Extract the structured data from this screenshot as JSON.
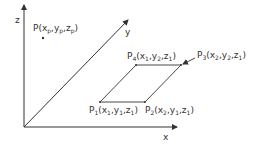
{
  "diagram": {
    "colors": {
      "line": "#333333",
      "background": "#ffffff"
    },
    "axes": {
      "x": {
        "label": "x"
      },
      "y": {
        "label": "y"
      },
      "z": {
        "label": "z"
      }
    },
    "point_p": {
      "name": "P",
      "open": "(",
      "x": "x",
      "x_sub": "p",
      "y": "y",
      "y_sub": "p",
      "z": "z",
      "z_sub": "p",
      "close": ")"
    },
    "vertices": [
      {
        "name": "P",
        "idx": "1",
        "x": "x",
        "xs": "1",
        "y": "y",
        "ys": "1",
        "z": "z",
        "zs": "1"
      },
      {
        "name": "P",
        "idx": "2",
        "x": "x",
        "xs": "2",
        "y": "y",
        "ys": "1",
        "z": "z",
        "zs": "1"
      },
      {
        "name": "P",
        "idx": "3",
        "x": "x",
        "xs": "2",
        "y": "y",
        "ys": "2",
        "z": "z",
        "zs": "1"
      },
      {
        "name": "P",
        "idx": "4",
        "x": "x",
        "xs": "1",
        "y": "y",
        "ys": "2",
        "z": "z",
        "zs": "1"
      }
    ],
    "punct": {
      "open": "(",
      "comma": ",",
      "close": ")"
    }
  }
}
